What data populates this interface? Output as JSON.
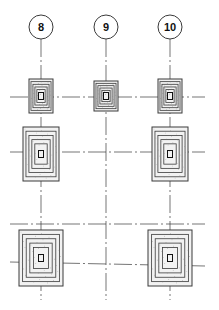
{
  "drawing": {
    "type": "foundation-plan",
    "line_color": "#3a3a3a",
    "fill_color": "#f2f2f2",
    "grid_bubbles": [
      {
        "label": "8",
        "x": 41,
        "y": 27
      },
      {
        "label": "9",
        "x": 106,
        "y": 27
      },
      {
        "label": "10",
        "x": 170,
        "y": 27
      }
    ],
    "grid_columns_x": [
      41,
      106,
      170
    ],
    "grid_rows_y": [
      97,
      152,
      224,
      262
    ],
    "footings": [
      {
        "grid": "8",
        "row": 1,
        "cx": 41,
        "cy": 96,
        "w": 24,
        "h": 34
      },
      {
        "grid": "9",
        "row": 1,
        "cx": 106,
        "cy": 96,
        "w": 24,
        "h": 30
      },
      {
        "grid": "10",
        "row": 1,
        "cx": 170,
        "cy": 96,
        "w": 24,
        "h": 34
      },
      {
        "grid": "8",
        "row": 2,
        "cx": 41,
        "cy": 154,
        "w": 36,
        "h": 54
      },
      {
        "grid": "10",
        "row": 2,
        "cx": 170,
        "cy": 154,
        "w": 36,
        "h": 54
      },
      {
        "grid": "8",
        "row": 3,
        "cx": 41,
        "cy": 258,
        "w": 44,
        "h": 56
      },
      {
        "grid": "10",
        "row": 3,
        "cx": 170,
        "cy": 258,
        "w": 44,
        "h": 56
      }
    ]
  }
}
